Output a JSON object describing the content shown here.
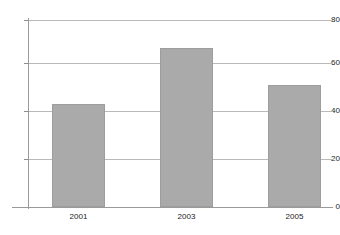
{
  "chart_data": {
    "type": "bar",
    "title": "",
    "subtitle": "",
    "xlabel": "",
    "ylabel": "",
    "categories": [
      "2001",
      "2003",
      "2005"
    ],
    "values": [
      44,
      68,
      52
    ],
    "series": [
      {
        "name": "",
        "values": [
          44,
          68,
          52
        ]
      }
    ],
    "ylim": [
      0,
      80
    ],
    "yticks": [
      0,
      20,
      40,
      60,
      80
    ],
    "ytick_labels": [
      "0",
      "20",
      "40",
      "60",
      "80"
    ],
    "xtick_labels": [
      "2001",
      "2003",
      "2005"
    ],
    "grid": true,
    "grid_axis": "y",
    "legend": false,
    "legend_position": "none",
    "annotations": [],
    "colors": {
      "bar_fill": "#aaaaaa",
      "bar_border": "#9d9d9d",
      "gridline": "#b9b9b9",
      "axis": "#9a9a9a",
      "text": "#1a1a1a",
      "background": "#ffffff"
    }
  }
}
